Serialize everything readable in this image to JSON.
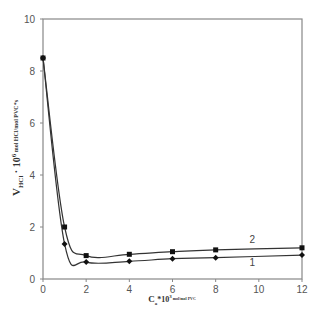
{
  "chart_data": {
    "type": "line",
    "title": "",
    "xlabel": "C_a*10^3 mol/mol PVC",
    "ylabel": "V_HCl · 10^6 mol HCl/mol PVC*s",
    "xlabel_parts": {
      "main": "C",
      "sub": "a",
      "mid": "*10",
      "sup": "3",
      "unit": " mol/mol PVC"
    },
    "ylabel_parts": {
      "main": "V",
      "sub": "HCl",
      "mid": " · 10",
      "sup": "6",
      "unit": "  mol HCl/mol PVC*s"
    },
    "xlim": [
      0,
      12
    ],
    "ylim": [
      0,
      10
    ],
    "xticks": [
      0,
      2,
      4,
      6,
      8,
      10,
      12
    ],
    "yticks": [
      0,
      2,
      4,
      6,
      8,
      10
    ],
    "grid": false,
    "legend": "inline labels near curves",
    "series": [
      {
        "name": "1",
        "marker": "diamond",
        "x": [
          0,
          1,
          2,
          4,
          6,
          8,
          12
        ],
        "values": [
          8.5,
          1.35,
          0.65,
          0.68,
          0.78,
          0.82,
          0.92
        ]
      },
      {
        "name": "2",
        "marker": "square",
        "x": [
          0,
          1,
          2,
          4,
          6,
          8,
          12
        ],
        "values": [
          8.5,
          2.0,
          0.9,
          0.95,
          1.05,
          1.12,
          1.2
        ]
      }
    ],
    "annotations": [
      {
        "text": "1",
        "x": 9.7,
        "y": 0.6
      },
      {
        "text": "2",
        "x": 9.7,
        "y": 1.5
      }
    ]
  },
  "colors": {
    "axis": "#888888",
    "line": "#333333",
    "marker": "#111111"
  }
}
